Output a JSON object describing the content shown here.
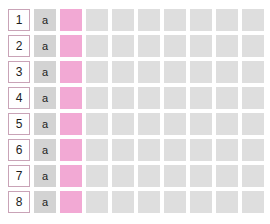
{
  "canvas": {
    "background_color": "#ffffff",
    "width": 270,
    "height": 224
  },
  "grid": {
    "row_count": 8,
    "column_count": 10,
    "cell_size_px": 22,
    "cell_gap_px": 4,
    "colors": {
      "row_header_background": "#ffffff",
      "row_header_border": "#c9a3b7",
      "row_header_text": "#1d1d1d",
      "letter_cell_background": "#d3d3d3",
      "letter_cell_text": "#1d1d1d",
      "highlight_cell_background": "#f2a9d4",
      "empty_cell_background": "#dedede"
    },
    "column_kinds": [
      "rownum",
      "letter",
      "pink",
      "empty",
      "empty",
      "empty",
      "empty",
      "empty",
      "empty",
      "empty"
    ],
    "rows": [
      {
        "number": "1",
        "letter": "a"
      },
      {
        "number": "2",
        "letter": "a"
      },
      {
        "number": "3",
        "letter": "a"
      },
      {
        "number": "4",
        "letter": "a"
      },
      {
        "number": "5",
        "letter": "a"
      },
      {
        "number": "6",
        "letter": "a"
      },
      {
        "number": "7",
        "letter": "a"
      },
      {
        "number": "8",
        "letter": "a"
      }
    ]
  }
}
